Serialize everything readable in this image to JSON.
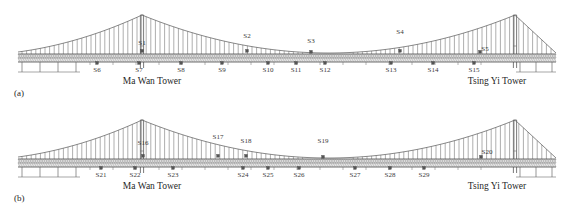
{
  "figure": {
    "type": "bridge-elevation-diagram",
    "panels": [
      {
        "tag": "(a)",
        "tag_x": 14,
        "tag_y": 88,
        "towers": [
          {
            "name": "Ma Wan Tower",
            "label": "Ma Wan Tower",
            "x": 142,
            "label_x": 152,
            "label_y": 76
          },
          {
            "name": "Tsing Yi Tower",
            "label": "Tsing Yi Tower",
            "x": 515,
            "label_x": 497,
            "label_y": 76
          }
        ],
        "sensors_above_deck": [
          {
            "label": "S1",
            "x": 142,
            "y": 40,
            "marker_x": 142,
            "marker_y": 52
          },
          {
            "label": "S2",
            "x": 247,
            "y": 33,
            "marker_x": 247,
            "marker_y": 52
          },
          {
            "label": "S3",
            "x": 311,
            "y": 38,
            "marker_x": 311,
            "marker_y": 53
          },
          {
            "label": "S4",
            "x": 400,
            "y": 29,
            "marker_x": 400,
            "marker_y": 52
          },
          {
            "label": "S5",
            "x": 485,
            "y": 46,
            "marker_x": 480,
            "marker_y": 53
          }
        ],
        "sensors_below_deck": [
          {
            "label": "S6",
            "x": 97,
            "y": 67,
            "marker_x": 97,
            "marker_y": 62
          },
          {
            "label": "S7",
            "x": 139,
            "y": 67,
            "marker_x": 139,
            "marker_y": 62
          },
          {
            "label": "S8",
            "x": 181,
            "y": 67,
            "marker_x": 181,
            "marker_y": 62
          },
          {
            "label": "S9",
            "x": 222,
            "y": 67,
            "marker_x": 222,
            "marker_y": 62
          },
          {
            "label": "S10",
            "x": 268,
            "y": 67,
            "marker_x": 268,
            "marker_y": 62
          },
          {
            "label": "S11",
            "x": 296,
            "y": 67,
            "marker_x": 296,
            "marker_y": 62
          },
          {
            "label": "S12",
            "x": 325,
            "y": 67,
            "marker_x": 325,
            "marker_y": 62
          },
          {
            "label": "S13",
            "x": 391,
            "y": 67,
            "marker_x": 391,
            "marker_y": 62
          },
          {
            "label": "S14",
            "x": 433,
            "y": 67,
            "marker_x": 433,
            "marker_y": 62
          },
          {
            "label": "S15",
            "x": 474,
            "y": 67,
            "marker_x": 474,
            "marker_y": 62
          }
        ]
      },
      {
        "tag": "(b)",
        "tag_x": 14,
        "tag_y": 88,
        "towers": [
          {
            "name": "Ma Wan Tower",
            "label": "Ma Wan Tower",
            "x": 142,
            "label_x": 152,
            "label_y": 76
          },
          {
            "name": "Tsing Yi Tower",
            "label": "Tsing Yi Tower",
            "x": 515,
            "label_x": 497,
            "label_y": 76
          }
        ],
        "sensors_above_deck": [
          {
            "label": "S16",
            "x": 143,
            "y": 35,
            "marker_x": 143,
            "marker_y": 52
          },
          {
            "label": "S17",
            "x": 218,
            "y": 29,
            "marker_x": 218,
            "marker_y": 52
          },
          {
            "label": "S18",
            "x": 246,
            "y": 33,
            "marker_x": 246,
            "marker_y": 52
          },
          {
            "label": "S19",
            "x": 323,
            "y": 33,
            "marker_x": 323,
            "marker_y": 53
          },
          {
            "label": "S20",
            "x": 487,
            "y": 44,
            "marker_x": 481,
            "marker_y": 53
          }
        ],
        "sensors_below_deck": [
          {
            "label": "S21",
            "x": 101,
            "y": 67,
            "marker_x": 101,
            "marker_y": 62
          },
          {
            "label": "S22",
            "x": 135,
            "y": 67,
            "marker_x": 135,
            "marker_y": 62
          },
          {
            "label": "S23",
            "x": 173,
            "y": 67,
            "marker_x": 173,
            "marker_y": 62
          },
          {
            "label": "S24",
            "x": 243,
            "y": 67,
            "marker_x": 243,
            "marker_y": 62
          },
          {
            "label": "S25",
            "x": 268,
            "y": 67,
            "marker_x": 268,
            "marker_y": 62
          },
          {
            "label": "S26",
            "x": 299,
            "y": 67,
            "marker_x": 299,
            "marker_y": 62
          },
          {
            "label": "S27",
            "x": 355,
            "y": 67,
            "marker_x": 355,
            "marker_y": 62
          },
          {
            "label": "S28",
            "x": 390,
            "y": 67,
            "marker_x": 390,
            "marker_y": 62
          },
          {
            "label": "S29",
            "x": 424,
            "y": 67,
            "marker_x": 424,
            "marker_y": 62
          }
        ]
      }
    ],
    "geometry": {
      "deck_top_y": 54,
      "deck_bottom_y": 62,
      "tower_left_x": 142,
      "tower_right_x": 515,
      "tower_top_y": 15,
      "left_anchor_x": 18,
      "right_anchor_x": 556,
      "cable_mid_x": 328,
      "cable_sag_y": 53,
      "piers_left": [
        22,
        40,
        58,
        76
      ],
      "piers_right": [
        520,
        536,
        552
      ]
    },
    "colors": {
      "line": "#6b6b6b",
      "deck_fill": "#d9d9d9",
      "marker": "#555555",
      "text": "#2b2b2b"
    }
  }
}
